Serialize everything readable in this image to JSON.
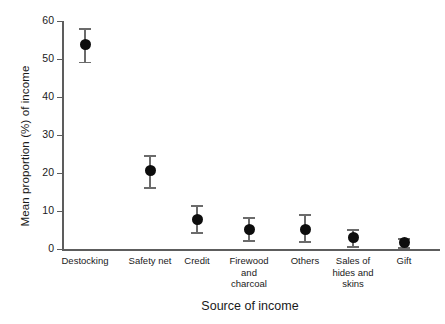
{
  "chart_data": {
    "type": "scatter",
    "title": "",
    "xlabel": "Source of income",
    "ylabel": "Mean proportion (%) of income",
    "categories": [
      "Destocking",
      "Safety net",
      "Credit",
      "Firewood and charcoal",
      "Others",
      "Sales of hides and skins",
      "Gift"
    ],
    "category_lines": [
      [
        "Destocking"
      ],
      [
        "Safety net"
      ],
      [
        "Credit"
      ],
      [
        "Firewood",
        "and",
        "charcoal"
      ],
      [
        "Others"
      ],
      [
        "Sales of",
        "hides and",
        "skins"
      ],
      [
        "Gift"
      ]
    ],
    "values": [
      53.8,
      20.6,
      7.7,
      5.1,
      5.1,
      2.9,
      1.6
    ],
    "error_upper": [
      58.2,
      24.7,
      11.5,
      8.3,
      9.2,
      5.3,
      2.9
    ],
    "error_lower": [
      49.3,
      16.3,
      4.5,
      2.3,
      2.0,
      0.8,
      0.5
    ],
    "ylim": [
      0,
      60
    ],
    "yticks": [
      0,
      10,
      20,
      30,
      40,
      50,
      60
    ],
    "ytick_labels": [
      "0",
      "10",
      "20",
      "30",
      "40",
      "50",
      "60"
    ],
    "grid": false,
    "legend": null,
    "marker_style": "filled-circle",
    "marker_color": "#0d0d0d",
    "errorbar_color": "#6b6b6b",
    "axis_color": "#5d5d5d"
  }
}
